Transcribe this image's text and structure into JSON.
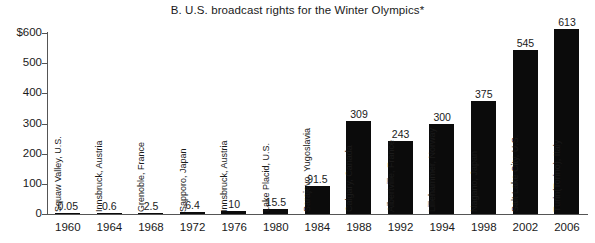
{
  "chart_data": {
    "type": "bar",
    "title": "B.  U.S. broadcast rights for the Winter Olympics*",
    "xlabel": "",
    "ylabel": "",
    "ylim": [
      0,
      600
    ],
    "grid": false,
    "legend": "none",
    "y_ticks": [
      "$600",
      "500",
      "400",
      "300",
      "200",
      "100",
      "0"
    ],
    "y_tick_values": [
      600,
      500,
      400,
      300,
      200,
      100,
      0
    ],
    "categories": [
      "1960",
      "1964",
      "1968",
      "1972",
      "1976",
      "1980",
      "1984",
      "1988",
      "1992",
      "1994",
      "1998",
      "2002",
      "2006"
    ],
    "values": [
      0.05,
      0.6,
      2.5,
      6.4,
      10,
      15.5,
      91.5,
      309,
      243,
      300,
      375,
      545,
      613
    ],
    "value_labels": [
      "0.05",
      "0.6",
      "2.5",
      "6.4",
      "10",
      "15.5",
      "91.5",
      "309",
      "243",
      "300",
      "375",
      "545",
      "613"
    ],
    "point_labels": [
      "Squaw Valley, U.S.",
      "Innsbruck, Austria",
      "Grenoble, France",
      "Sapporo, Japan",
      "Innsbruck, Austria",
      "Lake Placid, U.S.",
      "Sarajevo, Yugoslavia",
      "Calgary, Canada",
      "Albertville, France",
      "Lillehammer, Norway",
      "Nagano, Japan",
      "Salt Lake City, U.S.",
      "Turin(Torino), Italy"
    ],
    "bar_color": "#0b0b0b",
    "axis_color": "#555555",
    "text_color": "#1a1a1a"
  }
}
